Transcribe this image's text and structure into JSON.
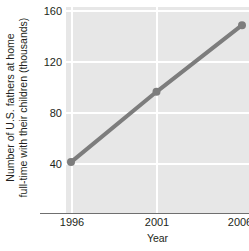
{
  "chart_data": {
    "type": "line",
    "title": "",
    "xlabel": "Year",
    "ylabel": "Number of U.S. fathers at home full-time with their children (thousands)",
    "ylabel_lines": [
      "Number of U.S. fathers at home",
      "full-time with their children (thousands)"
    ],
    "x": [
      1996,
      2001,
      2006
    ],
    "values": [
      40,
      98,
      153
    ],
    "series": [
      {
        "name": "Fathers at home full-time",
        "values": [
          40,
          98,
          153
        ]
      }
    ],
    "xtick_labels": [
      "1996",
      "2001",
      "2006"
    ],
    "ytick_labels": [
      "40",
      "80",
      "120",
      "160"
    ],
    "yticks": [
      40,
      80,
      120,
      160
    ],
    "xlim": [
      1996,
      2006
    ],
    "ylim": [
      -2,
      168
    ],
    "grid": "both",
    "legend": "none",
    "colors": {
      "line": "#7d7d7d",
      "marker": "#7d7d7d",
      "plot_background": "#e7e7e7",
      "gridline": "#ffffff",
      "axis": "#6f6f6f",
      "text": "#231f20",
      "page_background": "#ffffff"
    },
    "marker_radius_px": 4,
    "line_width_px": 4
  }
}
